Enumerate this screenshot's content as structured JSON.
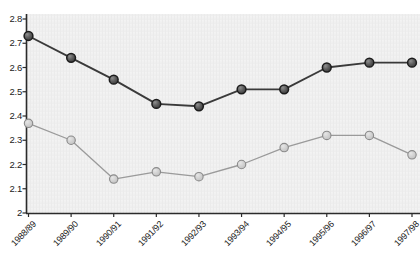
{
  "chart_data": {
    "type": "line",
    "title": "",
    "subtitle": "",
    "xlabel": "",
    "ylabel": "",
    "categories": [
      "1988/89",
      "1989/90",
      "1990/91",
      "1991/92",
      "1992/93",
      "1993/94",
      "1994/95",
      "1995/96",
      "1996/97",
      "1997/98"
    ],
    "series": [
      {
        "name": "dark-series",
        "color": "#3a3a3a",
        "marker_fill": "#6e6e6e",
        "marker_stroke": "#1c1c1c",
        "values": [
          2.73,
          2.64,
          2.55,
          2.45,
          2.44,
          2.51,
          2.51,
          2.6,
          2.62,
          2.62
        ]
      },
      {
        "name": "light-series",
        "color": "#9a9a9a",
        "marker_fill": "#cfcfcf",
        "marker_stroke": "#8a8a8a",
        "values": [
          2.37,
          2.3,
          2.14,
          2.17,
          2.15,
          2.2,
          2.27,
          2.32,
          2.32,
          2.24
        ]
      }
    ],
    "ylim": [
      2.0,
      2.8
    ],
    "ytick_labels": [
      "2",
      "2.1",
      "2.2",
      "2.3",
      "2.4",
      "2.5",
      "2.6",
      "2.7",
      "2.8"
    ],
    "ytick_values": [
      2.0,
      2.1,
      2.2,
      2.3,
      2.4,
      2.5,
      2.6,
      2.7,
      2.8
    ],
    "grid": false,
    "legend": "none",
    "plot_background": "#f2f2f2",
    "axis_color": "#2b2b2b"
  }
}
